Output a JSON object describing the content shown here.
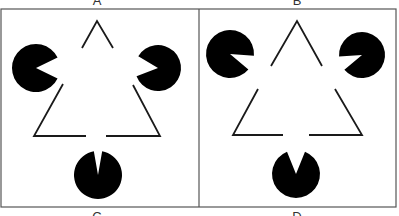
{
  "figure": {
    "frame": {
      "x": 1,
      "y": 9,
      "width": 395,
      "height": 198,
      "divider_x": 199,
      "stroke": "#555555",
      "stroke_width": 1.2
    },
    "colors": {
      "background": "#ffffff",
      "ink": "#000000",
      "line": "#1a1a1a"
    },
    "panels": [
      {
        "id": "A",
        "label": "A",
        "label_pos": {
          "x": 97,
          "y": -6
        },
        "pacmen": [
          {
            "name": "left-inducer",
            "cx": 36,
            "cy": 68,
            "r": 24,
            "mouth_dir": 0,
            "mouth_half": 26
          },
          {
            "name": "right-inducer",
            "cx": 158,
            "cy": 68,
            "r": 23,
            "mouth_dir": 185,
            "mouth_half": 26
          },
          {
            "name": "bottom-inducer",
            "cx": 98,
            "cy": 175,
            "r": 24,
            "mouth_dir": -90,
            "mouth_half": 10
          }
        ],
        "lines": [
          {
            "name": "apex-left",
            "points": [
              [
                82,
                48
              ],
              [
                97,
                21
              ],
              [
                113,
                48
              ]
            ]
          },
          {
            "name": "left-corner",
            "points": [
              [
                63,
                84
              ],
              [
                34,
                136
              ],
              [
                86,
                136
              ]
            ]
          },
          {
            "name": "right-corner",
            "points": [
              [
                106,
                136
              ],
              [
                160,
                136
              ],
              [
                133,
                85
              ]
            ]
          }
        ]
      },
      {
        "id": "B",
        "label": "B",
        "label_pos": {
          "x": 297,
          "y": -6
        },
        "pacmen": [
          {
            "name": "left-inducer",
            "cx": 230,
            "cy": 54,
            "r": 24,
            "mouth_dir": 22,
            "mouth_half": 18
          },
          {
            "name": "right-inducer",
            "cx": 362,
            "cy": 55,
            "r": 23,
            "mouth_dir": 158,
            "mouth_half": 18
          },
          {
            "name": "bottom-inducer",
            "cx": 296,
            "cy": 174,
            "r": 24,
            "mouth_dir": -90,
            "mouth_half": 22
          }
        ],
        "lines": [
          {
            "name": "apex",
            "points": [
              [
                271,
                66
              ],
              [
                297,
                21
              ],
              [
                322,
                66
              ]
            ]
          },
          {
            "name": "left-corner",
            "points": [
              [
                258,
                89
              ],
              [
                233,
                135
              ],
              [
                283,
                135
              ]
            ]
          },
          {
            "name": "right-corner",
            "points": [
              [
                309,
                135
              ],
              [
                362,
                135
              ],
              [
                335,
                89
              ]
            ]
          }
        ]
      }
    ],
    "bottom_labels": [
      {
        "id": "C",
        "label": "C",
        "x": 97,
        "y": 210
      },
      {
        "id": "D",
        "label": "D",
        "x": 297,
        "y": 210
      }
    ]
  }
}
